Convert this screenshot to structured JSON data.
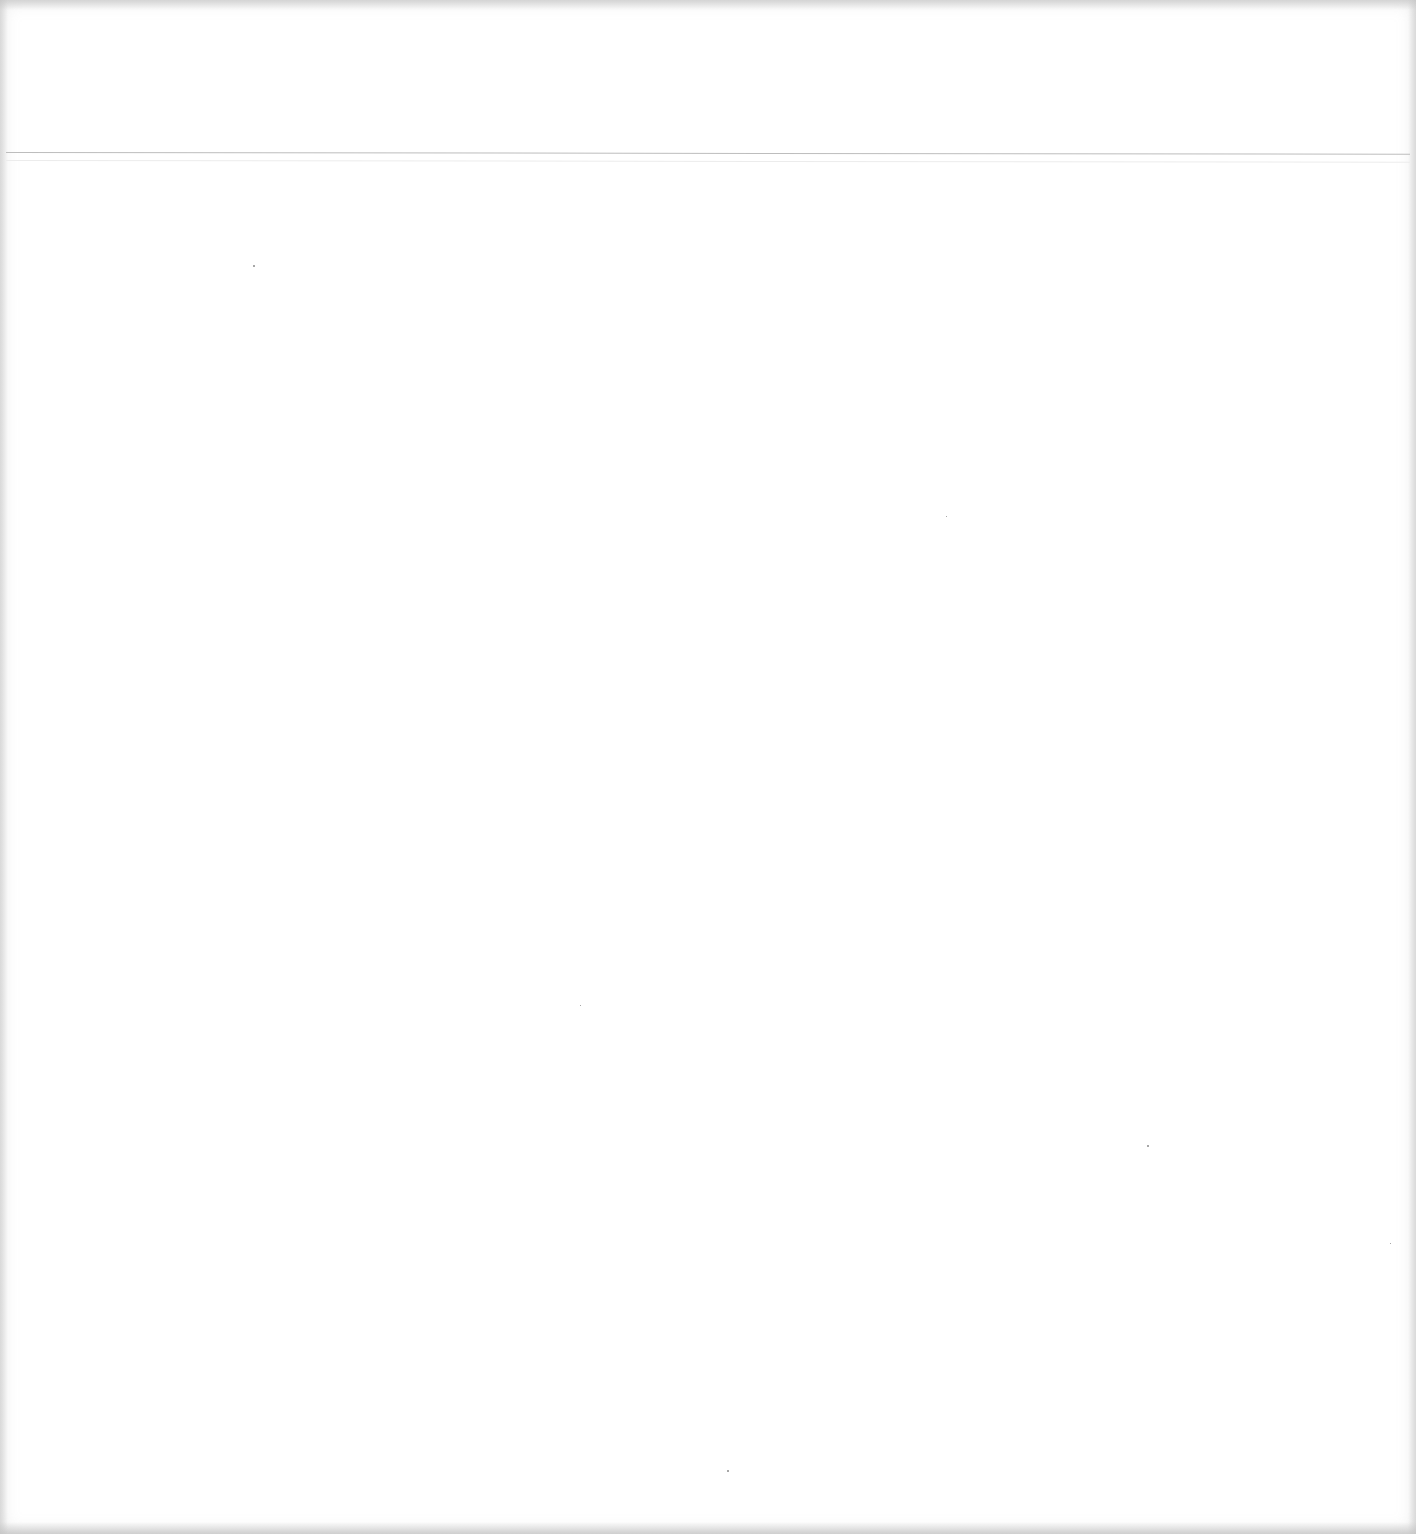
{
  "page": {
    "type": "blank scanned page",
    "text_content": "",
    "has_header_rule": true,
    "colors": {
      "background": "#ffffff",
      "rule": "#bdbdbd"
    }
  }
}
